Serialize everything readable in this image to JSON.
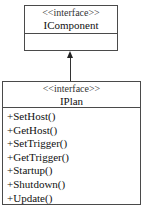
{
  "diagram": {
    "type": "uml-class",
    "classes": [
      {
        "id": "icomponent",
        "stereotype": "<<interface>>",
        "name": "IComponent",
        "operations": []
      },
      {
        "id": "iplan",
        "stereotype": "<<interface>>",
        "name": "IPlan",
        "operations": [
          "+SetHost()",
          "+GetHost()",
          "+SetTrigger()",
          "+GetTrigger()",
          "+Startup()",
          "+Shutdown()",
          "+Update()"
        ]
      }
    ],
    "relations": [
      {
        "from": "iplan",
        "to": "icomponent",
        "kind": "inheritance-arrow"
      }
    ]
  }
}
